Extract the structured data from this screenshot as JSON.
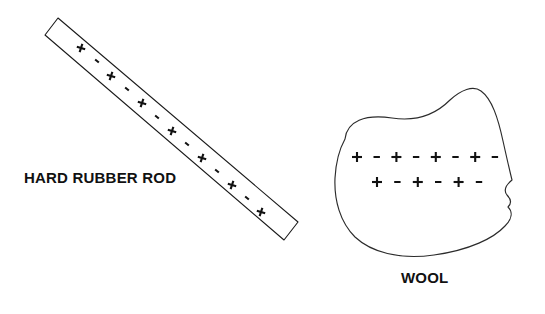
{
  "figure": {
    "background_color": "#ffffff",
    "line_color": "#1a1a1a",
    "symbol_color": "#111111"
  },
  "rod": {
    "label": "HARD RUBBER ROD",
    "shape": "rectangle",
    "rotation_degrees": 39,
    "charge_sequence": [
      "+",
      "-",
      "+",
      "-",
      "+",
      "-",
      "+",
      "-",
      "+",
      "-",
      "+",
      "-",
      "+"
    ],
    "plus_count": 7,
    "minus_count": 6,
    "corners": [
      {
        "x": 45,
        "y": 35
      },
      {
        "x": 58,
        "y": 18
      },
      {
        "x": 298,
        "y": 222
      },
      {
        "x": 284,
        "y": 240
      }
    ],
    "charge_positions": [
      {
        "symbol": "+",
        "x": 81,
        "y": 48
      },
      {
        "symbol": "-",
        "x": 97,
        "y": 61
      },
      {
        "symbol": "+",
        "x": 111,
        "y": 76
      },
      {
        "symbol": "-",
        "x": 127,
        "y": 89
      },
      {
        "symbol": "+",
        "x": 142,
        "y": 103
      },
      {
        "symbol": "-",
        "x": 157,
        "y": 117
      },
      {
        "symbol": "+",
        "x": 172,
        "y": 131
      },
      {
        "symbol": "-",
        "x": 187,
        "y": 144
      },
      {
        "symbol": "+",
        "x": 202,
        "y": 158
      },
      {
        "symbol": "-",
        "x": 217,
        "y": 171
      },
      {
        "symbol": "+",
        "x": 232,
        "y": 185
      },
      {
        "symbol": "-",
        "x": 247,
        "y": 198
      },
      {
        "symbol": "+",
        "x": 261,
        "y": 212
      }
    ]
  },
  "wool": {
    "label": "WOOL",
    "shape": "irregular-blob",
    "rows": [
      {
        "sequence": [
          "+",
          "-",
          "+",
          "-",
          "+",
          "-",
          "+",
          "-"
        ],
        "plus_count": 4,
        "minus_count": 4,
        "y": 157,
        "x_start": 357,
        "x_step": 19.7
      },
      {
        "sequence": [
          "+",
          "-",
          "+",
          "-",
          "+",
          "-"
        ],
        "plus_count": 3,
        "minus_count": 3,
        "y": 182,
        "x_start": 377,
        "x_step": 20.4
      }
    ],
    "outline_path": "M 345 139 C 347 121, 365 114, 392 118 C 418 122, 436 114, 450 100 C 461 90, 473 85, 481 91 C 492 99, 498 118, 503 141 C 507 159, 510 172, 512 180 C 506 185, 503 190, 507 195 C 511 199, 512 203, 508 207 C 513 212, 512 219, 505 226 C 494 238, 470 250, 434 255 C 399 260, 371 252, 355 237 C 340 222, 334 200, 335 178 C 336 160, 340 148, 345 139 Z"
  }
}
